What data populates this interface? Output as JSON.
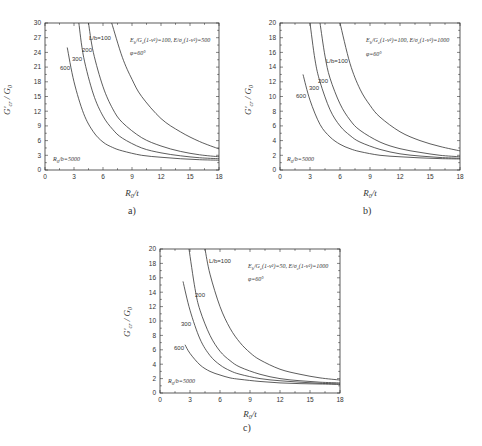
{
  "chart_data": [
    {
      "id": "a",
      "type": "line",
      "caption": "a)",
      "xlabel": "R0/t",
      "ylabel": "G'cr / G0",
      "xlim": [
        0,
        18
      ],
      "ylim": [
        0,
        30
      ],
      "xticks": [
        0,
        3,
        6,
        9,
        12,
        15,
        18
      ],
      "yticks": [
        0,
        3,
        6,
        9,
        12,
        15,
        18,
        21,
        24,
        27,
        30
      ],
      "grid": false,
      "annotations": [
        "Eb/Gc(1-ν²)=100, E/σc(1-ν²)=500",
        "φ=60°",
        "R0/b=5000"
      ],
      "series": [
        {
          "name": "L/b=100",
          "label": "L/b=100",
          "points": [
            [
              6.9,
              30
            ],
            [
              8,
              23
            ],
            [
              9,
              18.5
            ],
            [
              10,
              15
            ],
            [
              12,
              10.5
            ],
            [
              14,
              7.8
            ],
            [
              16,
              5.8
            ],
            [
              18,
              4.3
            ]
          ]
        },
        {
          "name": "L/b=200",
          "label": "200",
          "points": [
            [
              4.5,
              30
            ],
            [
              5,
              24
            ],
            [
              6,
              17
            ],
            [
              7,
              12.5
            ],
            [
              8,
              9.7
            ],
            [
              10,
              6.6
            ],
            [
              12,
              4.9
            ],
            [
              14,
              3.8
            ],
            [
              16,
              3.1
            ],
            [
              18,
              2.7
            ]
          ]
        },
        {
          "name": "L/b=300",
          "label": "300",
          "points": [
            [
              3.5,
              30
            ],
            [
              4,
              23
            ],
            [
              5,
              15.5
            ],
            [
              6,
              11
            ],
            [
              7,
              8.3
            ],
            [
              8,
              6.5
            ],
            [
              10,
              4.5
            ],
            [
              12,
              3.5
            ],
            [
              14,
              2.9
            ],
            [
              16,
              2.5
            ],
            [
              18,
              2.3
            ]
          ]
        },
        {
          "name": "L/b=600",
          "label": "600",
          "points": [
            [
              2.3,
              25
            ],
            [
              3,
              18
            ],
            [
              4,
              11.5
            ],
            [
              5,
              7.8
            ],
            [
              6,
              5.7
            ],
            [
              7,
              4.6
            ],
            [
              8,
              3.9
            ],
            [
              10,
              3.0
            ],
            [
              12,
              2.6
            ],
            [
              14,
              2.3
            ],
            [
              16,
              2.1
            ],
            [
              18,
              2.0
            ]
          ]
        }
      ]
    },
    {
      "id": "b",
      "type": "line",
      "caption": "b)",
      "xlabel": "R0/t",
      "ylabel": "G'cr / G0",
      "xlim": [
        0,
        18
      ],
      "ylim": [
        0,
        20
      ],
      "xticks": [
        0,
        3,
        6,
        9,
        12,
        15,
        18
      ],
      "yticks": [
        0,
        2,
        4,
        6,
        8,
        10,
        12,
        14,
        16,
        18,
        20
      ],
      "grid": false,
      "annotations": [
        "Eb/Gc(1-ν²)=100, E/σc(1-ν²)=1000",
        "φ=60°",
        "R0/b=5000"
      ],
      "series": [
        {
          "name": "L/b=100",
          "label": "L/b=100",
          "points": [
            [
              6,
              20
            ],
            [
              7,
              14.5
            ],
            [
              8,
              11
            ],
            [
              9,
              8.8
            ],
            [
              10,
              7.2
            ],
            [
              12,
              5.2
            ],
            [
              14,
              4.0
            ],
            [
              16,
              3.2
            ],
            [
              18,
              2.6
            ]
          ]
        },
        {
          "name": "L/b=200",
          "label": "200",
          "points": [
            [
              4,
              20
            ],
            [
              4.5,
              15.5
            ],
            [
              5,
              12.5
            ],
            [
              6,
              9
            ],
            [
              7,
              6.8
            ],
            [
              8,
              5.4
            ],
            [
              10,
              3.8
            ],
            [
              12,
              2.9
            ],
            [
              14,
              2.4
            ],
            [
              16,
              2.0
            ],
            [
              18,
              1.8
            ]
          ]
        },
        {
          "name": "L/b=300",
          "label": "300",
          "points": [
            [
              3,
              20
            ],
            [
              3.5,
              15
            ],
            [
              4,
              12
            ],
            [
              5,
              8.2
            ],
            [
              6,
              6
            ],
            [
              7,
              4.7
            ],
            [
              8,
              3.8
            ],
            [
              10,
              2.8
            ],
            [
              12,
              2.2
            ],
            [
              14,
              1.9
            ],
            [
              16,
              1.7
            ],
            [
              18,
              1.6
            ]
          ]
        },
        {
          "name": "L/b=600",
          "label": "600",
          "points": [
            [
              2.3,
              13
            ],
            [
              3,
              9.5
            ],
            [
              4,
              6.2
            ],
            [
              5,
              4.5
            ],
            [
              6,
              3.5
            ],
            [
              7,
              2.9
            ],
            [
              8,
              2.5
            ],
            [
              10,
              2.0
            ],
            [
              12,
              1.8
            ],
            [
              14,
              1.65
            ],
            [
              16,
              1.55
            ],
            [
              18,
              1.5
            ]
          ]
        }
      ]
    },
    {
      "id": "c",
      "type": "line",
      "caption": "c)",
      "xlabel": "R0/t",
      "ylabel": "G'cr / G0",
      "xlim": [
        0,
        18
      ],
      "ylim": [
        0,
        20
      ],
      "xticks": [
        0,
        3,
        6,
        9,
        12,
        15,
        18
      ],
      "yticks": [
        0,
        2,
        4,
        6,
        8,
        10,
        12,
        14,
        16,
        18,
        20
      ],
      "grid": false,
      "annotations": [
        "Eb/Gc(1-ν²)=50, E/σc(1-ν²)=1000",
        "φ=60°",
        "R0/b=5000"
      ],
      "series": [
        {
          "name": "L/b=100",
          "label": "L/b=100",
          "points": [
            [
              4.5,
              20
            ],
            [
              5,
              16.5
            ],
            [
              6,
              12
            ],
            [
              7,
              9
            ],
            [
              8,
              7
            ],
            [
              9,
              5.6
            ],
            [
              10,
              4.6
            ],
            [
              12,
              3.3
            ],
            [
              14,
              2.6
            ],
            [
              16,
              2.1
            ],
            [
              18,
              1.8
            ]
          ]
        },
        {
          "name": "L/b=200",
          "label": "200",
          "points": [
            [
              2.9,
              20
            ],
            [
              3.5,
              14.5
            ],
            [
              4,
              11.5
            ],
            [
              5,
              8
            ],
            [
              6,
              5.8
            ],
            [
              7,
              4.5
            ],
            [
              8,
              3.6
            ],
            [
              10,
              2.6
            ],
            [
              12,
              2.0
            ],
            [
              14,
              1.7
            ],
            [
              16,
              1.5
            ],
            [
              18,
              1.4
            ]
          ]
        },
        {
          "name": "L/b=300",
          "label": "300",
          "points": [
            [
              2.3,
              15.5
            ],
            [
              3,
              11.5
            ],
            [
              4,
              7.5
            ],
            [
              5,
              5.2
            ],
            [
              6,
              3.9
            ],
            [
              7,
              3.1
            ],
            [
              8,
              2.6
            ],
            [
              10,
              2.0
            ],
            [
              12,
              1.7
            ],
            [
              14,
              1.5
            ],
            [
              16,
              1.35
            ],
            [
              18,
              1.25
            ]
          ]
        },
        {
          "name": "L/b=600",
          "label": "600",
          "points": [
            [
              2.5,
              6.7
            ],
            [
              3,
              5.5
            ],
            [
              4,
              3.9
            ],
            [
              5,
              3.0
            ],
            [
              6,
              2.5
            ],
            [
              7,
              2.1
            ],
            [
              8,
              1.9
            ],
            [
              10,
              1.6
            ],
            [
              12,
              1.4
            ],
            [
              14,
              1.3
            ],
            [
              16,
              1.25
            ],
            [
              18,
              1.2
            ]
          ]
        }
      ]
    }
  ],
  "labels": {
    "a": {
      "caption": "a)",
      "xlabel": "R",
      "xlabel_sub": "0",
      "xlabel_tail": "/t",
      "ylabel": "G'",
      "ylabel_sub": "cr",
      "ylabel_tail": " / G",
      "ylabel_tail_sub": "0",
      "anno1": "E",
      "anno1_sub": "b",
      "anno1_rest": "/G",
      "anno1_sub2": "c",
      "anno1_tail": "(1-ν²)=100, E/σ",
      "anno1_sub3": "c",
      "anno1_end": "(1-ν²)=500",
      "anno2": "φ=60°",
      "anno3": "R",
      "anno3_sub": "0",
      "anno3_tail": "/b=5000",
      "c100": "L/b=100",
      "c200": "200",
      "c300": "300",
      "c600": "600"
    },
    "b": {
      "caption": "b)",
      "xlabel": "R",
      "xlabel_sub": "0",
      "xlabel_tail": "/t",
      "ylabel": "G'",
      "ylabel_sub": "cr",
      "ylabel_tail": " / G",
      "ylabel_tail_sub": "0",
      "anno1": "E",
      "anno1_sub": "b",
      "anno1_rest": "/G",
      "anno1_sub2": "c",
      "anno1_tail": "(1-ν²)=100, E/σ",
      "anno1_sub3": "c",
      "anno1_end": "(1-ν²)=1000",
      "anno2": "φ=60°",
      "anno3": "R",
      "anno3_sub": "0",
      "anno3_tail": "/b=5000",
      "c100": "L/b=100",
      "c200": "200",
      "c300": "300",
      "c600": "600"
    },
    "c": {
      "caption": "c)",
      "xlabel": "R",
      "xlabel_sub": "0",
      "xlabel_tail": "/t",
      "ylabel": "G'",
      "ylabel_sub": "cr",
      "ylabel_tail": " / G",
      "ylabel_tail_sub": "0",
      "anno1": "E",
      "anno1_sub": "b",
      "anno1_rest": "/G",
      "anno1_sub2": "c",
      "anno1_tail": "(1-ν²)=50, E/σ",
      "anno1_sub3": "c",
      "anno1_end": "(1-ν²)=1000",
      "anno2": "φ=60°",
      "anno3": "R",
      "anno3_sub": "0",
      "anno3_tail": "/b=5000",
      "c100": "L/b=100",
      "c200": "200",
      "c300": "300",
      "c600": "600"
    }
  }
}
